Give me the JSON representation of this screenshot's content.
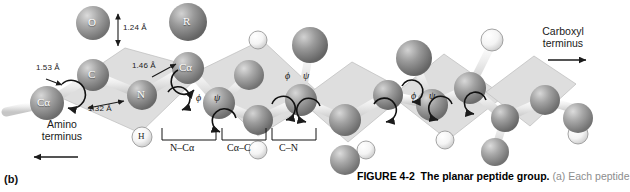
{
  "figure": {
    "panel_label": "(b)",
    "caption": {
      "figure_number": "FIGURE 4-2",
      "title": "The planar peptide group.",
      "body": "(a) Each peptide"
    }
  },
  "termini": {
    "amino": {
      "line1": "Amino",
      "line2": "terminus",
      "arrow": "left-arrow-icon"
    },
    "carboxyl": {
      "line1": "Carboxyl",
      "line2": "terminus",
      "arrow": "right-arrow-icon"
    }
  },
  "atoms": [
    {
      "id": "ca1",
      "label": "Cα",
      "kind": "carbon",
      "cx": 47,
      "cy": 103,
      "r": 17
    },
    {
      "id": "c1",
      "label": "C",
      "kind": "carbon",
      "cx": 93,
      "cy": 75,
      "r": 16
    },
    {
      "id": "o1",
      "label": "O",
      "kind": "oxygen",
      "cx": 93,
      "cy": 23,
      "r": 17
    },
    {
      "id": "n1",
      "label": "N",
      "kind": "nitrogen",
      "cx": 142,
      "cy": 95,
      "r": 15
    },
    {
      "id": "h1",
      "label": "H",
      "kind": "hydrogen",
      "cx": 142,
      "cy": 137,
      "r": 10
    },
    {
      "id": "ca2",
      "label": "Cα",
      "kind": "carbon",
      "cx": 188,
      "cy": 68,
      "r": 16
    },
    {
      "id": "r1",
      "label": "R",
      "kind": "rgroup",
      "cx": 188,
      "cy": 22,
      "r": 19
    },
    {
      "id": "c2",
      "label": "",
      "kind": "carbon",
      "cx": 219,
      "cy": 103,
      "r": 16
    },
    {
      "id": "o2",
      "label": "",
      "kind": "oxygen",
      "cx": 249,
      "cy": 75,
      "r": 15
    },
    {
      "id": "n2",
      "label": "",
      "kind": "nitrogen",
      "cx": 258,
      "cy": 120,
      "r": 15
    },
    {
      "id": "h2",
      "label": "",
      "kind": "hydrogen",
      "cx": 258,
      "cy": 150,
      "r": 9
    },
    {
      "id": "ca3",
      "label": "",
      "kind": "carbon",
      "cx": 301,
      "cy": 100,
      "r": 16
    },
    {
      "id": "r2",
      "label": "",
      "kind": "rgroup",
      "cx": 310,
      "cy": 45,
      "r": 18
    },
    {
      "id": "c3",
      "label": "",
      "kind": "carbon",
      "cx": 345,
      "cy": 120,
      "r": 16
    },
    {
      "id": "o3",
      "label": "",
      "kind": "oxygen",
      "cx": 345,
      "cy": 160,
      "r": 15
    },
    {
      "id": "n3",
      "label": "",
      "kind": "nitrogen",
      "cx": 388,
      "cy": 95,
      "r": 15
    },
    {
      "id": "ca4",
      "label": "",
      "kind": "carbon",
      "cx": 432,
      "cy": 105,
      "r": 16
    },
    {
      "id": "r3",
      "label": "",
      "kind": "rgroup",
      "cx": 414,
      "cy": 58,
      "r": 18
    },
    {
      "id": "c4",
      "label": "",
      "kind": "carbon",
      "cx": 470,
      "cy": 88,
      "r": 16
    },
    {
      "id": "o4",
      "label": "",
      "kind": "oxygen",
      "cx": 495,
      "cy": 150,
      "r": 15
    },
    {
      "id": "n4",
      "label": "",
      "kind": "nitrogen",
      "cx": 505,
      "cy": 118,
      "r": 14
    },
    {
      "id": "r4",
      "label": "",
      "kind": "rgroup",
      "cx": 492,
      "cy": 40,
      "r": 12
    }
  ],
  "bond_lengths": [
    {
      "id": "ca-c",
      "value": "1.53 Å",
      "x": 36,
      "y": 64
    },
    {
      "id": "c-o",
      "value": "1.24 Å",
      "x": 123,
      "y": 28
    },
    {
      "id": "c-n",
      "value": "1.32 Å",
      "x": 90,
      "y": 103
    },
    {
      "id": "n-ca",
      "value": "1.46 Å",
      "x": 133,
      "y": 62
    }
  ],
  "torsion_angles": [
    {
      "phi": "ϕ",
      "psi": "ψ",
      "x": 198,
      "y": 96
    },
    {
      "phi": "ϕ",
      "psi": "ψ",
      "x": 287,
      "y": 73
    },
    {
      "phi": "ϕ",
      "psi": "ψ",
      "x": 413,
      "y": 93
    }
  ],
  "bond_brackets": [
    {
      "label": "N–Cα",
      "x": 176,
      "y": 148,
      "width": 46
    },
    {
      "label": "Cα–C",
      "x": 228,
      "y": 148,
      "width": 40
    },
    {
      "label": "C–N",
      "x": 274,
      "y": 148,
      "width": 40
    }
  ],
  "colors": {
    "carbon": "#8e8e8e",
    "oxygen": "#9a9a9a",
    "nitrogen": "#8b8b8b",
    "hydrogen": "#f2f2f2",
    "rgroup": "#8a8a8a",
    "plane": "#d9d9d9",
    "bond": "#e8e8e8",
    "text": "#1b1b1b",
    "caption_fade": "#8d8d8d"
  }
}
